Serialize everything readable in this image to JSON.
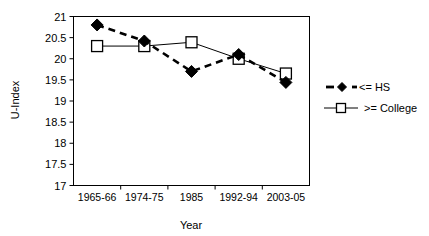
{
  "chart_data": {
    "type": "line",
    "title": "",
    "xlabel": "Year",
    "ylabel": "U-Index",
    "categories": [
      "1965-66",
      "1974-75",
      "1985",
      "1992-94",
      "2003-05"
    ],
    "ylim": [
      17,
      21
    ],
    "yticks": [
      17,
      17.5,
      18,
      18.5,
      19,
      19.5,
      20,
      20.5,
      21
    ],
    "ytick_labels": [
      "17",
      "17.5",
      "18",
      "18.5",
      "19",
      "19.5",
      "20",
      "20.5",
      "21"
    ],
    "grid": false,
    "legend_position": "right",
    "series": [
      {
        "name": "<= HS",
        "values": [
          20.8,
          20.42,
          19.7,
          20.1,
          19.44
        ],
        "line_style": "dashed",
        "marker": "diamond-filled",
        "color": "#000000"
      },
      {
        "name": ">= College",
        "values": [
          20.3,
          20.3,
          20.39,
          20.0,
          19.65
        ],
        "line_style": "solid",
        "marker": "square-open",
        "color": "#000000"
      }
    ]
  },
  "legend": {
    "entries": [
      {
        "label": "<= HS"
      },
      {
        "label": ">= College"
      }
    ]
  },
  "colors": {
    "foreground": "#000000",
    "background": "#ffffff"
  }
}
